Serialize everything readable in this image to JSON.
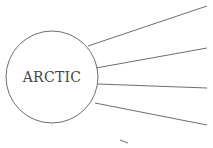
{
  "diagram": {
    "type": "mind-map",
    "center_node": {
      "label": "ARCTIC",
      "cx": 52,
      "cy": 77,
      "r": 46
    },
    "colors": {
      "stroke": "#6e6e6e",
      "text": "#444444",
      "background": "#ffffff"
    },
    "branches": [
      {
        "x1": 88,
        "y1": 46,
        "x2": 207,
        "y2": 6
      },
      {
        "x1": 96,
        "y1": 68,
        "x2": 207,
        "y2": 48
      },
      {
        "x1": 98,
        "y1": 84,
        "x2": 207,
        "y2": 88
      },
      {
        "x1": 95,
        "y1": 103,
        "x2": 207,
        "y2": 125
      }
    ],
    "partial_stroke": {
      "x1": 120,
      "y1": 140,
      "x2": 128,
      "y2": 143
    }
  }
}
